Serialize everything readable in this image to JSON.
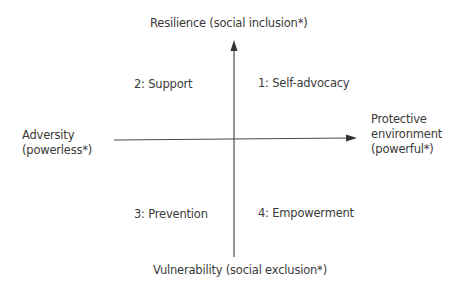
{
  "axes": {
    "top": "Resilience (social inclusion*)",
    "bottom": "Vulnerability (social exclusion*)",
    "left": [
      "Adversity",
      "(powerless*)"
    ],
    "right": [
      "Protective",
      "environment",
      "(powerful*)"
    ]
  },
  "quadrants": [
    {
      "id": 1,
      "label": "1: Self-advocacy",
      "position": "top-right"
    },
    {
      "id": 2,
      "label": "2: Support",
      "position": "top-left"
    },
    {
      "id": 3,
      "label": "3: Prevention",
      "position": "bottom-left"
    },
    {
      "id": 4,
      "label": "4: Empowerment",
      "position": "bottom-right"
    }
  ],
  "colors": {
    "line": "#4a4a4a",
    "text": "#3a3a3a"
  }
}
